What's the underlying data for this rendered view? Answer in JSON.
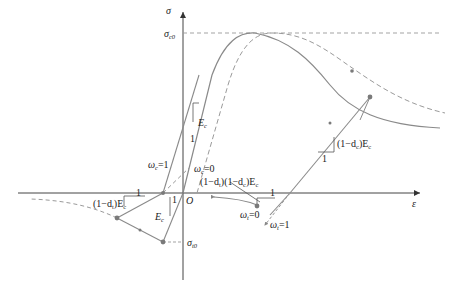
{
  "diagram": {
    "type": "constitutive stress-strain diagram (concrete damage model)",
    "axes": {
      "x_label": "ε",
      "y_label": "σ",
      "origin_label": "O"
    },
    "labels": {
      "sigma_c0": {
        "main": "σ",
        "sub": "c0"
      },
      "sigma_t0": {
        "main": "σ",
        "sub": "t0"
      },
      "Ec_top": {
        "main": "E",
        "sub": "c"
      },
      "Ec_left": {
        "main": "E",
        "sub": "c"
      },
      "one_top": "1",
      "one_left_horiz": "1",
      "one_left_vert": "1",
      "one_mid": "1",
      "one_right": "1",
      "omega_c1": {
        "main": "ω",
        "sub": "c",
        "eq": "=1"
      },
      "omega_c0": {
        "main": "ω",
        "sub": "c",
        "eq": "=0"
      },
      "omega_t0": {
        "main": "ω",
        "sub": "t",
        "eq": "=0"
      },
      "omega_t1": {
        "main": "ω",
        "sub": "t",
        "eq": "=1"
      },
      "slope_left": "(1−d_t)E_c",
      "slope_left_a": "(1−d",
      "slope_left_sub": "t",
      "slope_left_b": ")E",
      "slope_left_sub2": "c",
      "slope_mid_a": "(1−d",
      "slope_mid_sub1": "t",
      "slope_mid_b": ")(1−d",
      "slope_mid_sub2": "c",
      "slope_mid_c": ")E",
      "slope_mid_sub3": "c",
      "slope_right_a": "(1−d",
      "slope_right_sub": "c",
      "slope_right_b": ")E",
      "slope_right_sub2": "c"
    },
    "colors": {
      "axis": "#333333",
      "curve": "#8a8a8a",
      "dashed": "#9a9a9a",
      "marker": "#7a7a7a",
      "text": "#222222"
    }
  }
}
